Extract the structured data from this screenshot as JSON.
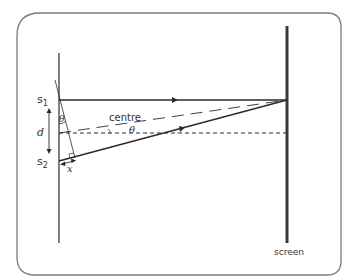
{
  "diagram": {
    "labels": {
      "s1_main": "s",
      "s1_sub": "1",
      "s2_main": "s",
      "s2_sub": "2",
      "separation": "d",
      "centre": "centre",
      "theta_slit": "θ",
      "theta_centre": "θ",
      "path_difference": "x",
      "screen": "screen"
    },
    "colors": {
      "frame": "#7a7a7a",
      "lines": "#2a2a2a",
      "screen": "#3a3a3a",
      "text": "#333333"
    }
  }
}
